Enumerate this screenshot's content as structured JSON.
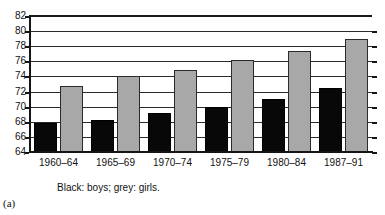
{
  "panel": {
    "label": "(a)"
  },
  "legend": {
    "note": "Black: boys;  grey: girls.",
    "boys_label": "Black: boys",
    "girls_label": "grey: girls"
  },
  "colors": {
    "boys": "#080808",
    "girls": "#a8a8a8",
    "axis": "#151515",
    "grid": "#2b2b2b",
    "background": "#ffffff"
  },
  "chart_data": {
    "type": "bar",
    "title": "",
    "subtitle": "",
    "xlabel": "",
    "ylabel": "",
    "categories": [
      "1960–64",
      "1965–69",
      "1970–74",
      "1975–79",
      "1980–84",
      "1987–91"
    ],
    "series": [
      {
        "name": "Black: boys",
        "color": "#080808",
        "values": [
          67.8,
          68.3,
          69.1,
          69.9,
          71.0,
          72.5
        ]
      },
      {
        "name": "grey: girls",
        "color": "#a8a8a8",
        "values": [
          72.7,
          74.0,
          74.9,
          76.2,
          77.4,
          79.0
        ]
      }
    ],
    "ylim": [
      64,
      82
    ],
    "yticks": [
      64,
      66,
      68,
      70,
      72,
      74,
      76,
      78,
      80,
      82
    ],
    "ytick_labels": [
      "64",
      "66",
      "68",
      "70",
      "72",
      "74",
      "76",
      "78",
      "80",
      "82"
    ],
    "grid": true,
    "grid_axis": "y",
    "legend_position": "below-axis",
    "annotations": [
      "Black: boys;  grey: girls.",
      "(a)"
    ]
  }
}
